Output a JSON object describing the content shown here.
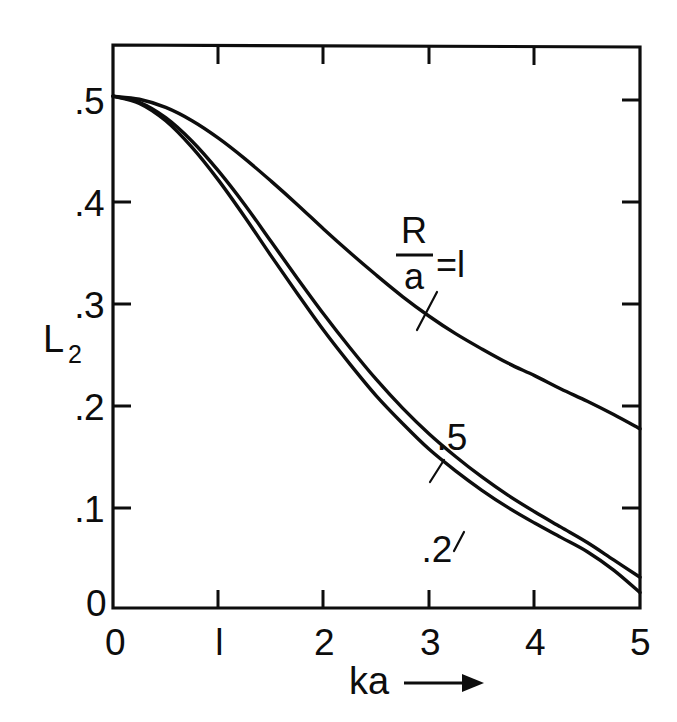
{
  "figure": {
    "background_color": "#ffffff",
    "ink_color": "#0d0d0d"
  },
  "chart_data": {
    "type": "line",
    "title": "",
    "subtitle": "",
    "xlabel": "ka",
    "xlabel_suffix": "⟶",
    "ylabel": "L",
    "ylabel_subscript": "2",
    "xlim": [
      0,
      5
    ],
    "ylim": [
      0,
      0.55
    ],
    "grid": false,
    "legend": "inline-curve-labels",
    "x_ticks": [
      0,
      1,
      2,
      3,
      4,
      5
    ],
    "x_tick_labels": [
      "0",
      "l",
      "2",
      "3",
      "4",
      "5"
    ],
    "y_ticks": [
      0,
      0.1,
      0.2,
      0.3,
      0.4,
      0.5
    ],
    "y_tick_labels": [
      "0",
      ".1",
      ".2",
      ".3",
      ".4",
      ".5"
    ],
    "x": [
      0,
      0.25,
      0.5,
      0.75,
      1.0,
      1.25,
      1.5,
      1.75,
      2.0,
      2.25,
      2.5,
      2.75,
      3.0,
      3.25,
      3.5,
      3.75,
      4.0,
      4.25,
      4.5,
      4.75,
      5.0
    ],
    "series": [
      {
        "name": "R/a = 1",
        "label": "1",
        "values": [
          0.5,
          0.497,
          0.489,
          0.476,
          0.459,
          0.439,
          0.417,
          0.394,
          0.37,
          0.347,
          0.325,
          0.304,
          0.285,
          0.268,
          0.253,
          0.239,
          0.227,
          0.214,
          0.202,
          0.189,
          0.175
        ]
      },
      {
        "name": "R/a = .5",
        "label": ".5",
        "values": [
          0.5,
          0.494,
          0.479,
          0.456,
          0.427,
          0.394,
          0.358,
          0.322,
          0.287,
          0.254,
          0.223,
          0.195,
          0.17,
          0.148,
          0.128,
          0.11,
          0.094,
          0.079,
          0.064,
          0.047,
          0.03
        ]
      },
      {
        "name": "R/a = .2",
        "label": ".2",
        "values": [
          0.5,
          0.493,
          0.476,
          0.45,
          0.418,
          0.382,
          0.344,
          0.307,
          0.271,
          0.238,
          0.207,
          0.18,
          0.155,
          0.134,
          0.115,
          0.098,
          0.083,
          0.069,
          0.055,
          0.037,
          0.015
        ]
      }
    ],
    "annotations": [
      {
        "text": "R",
        "role": "fraction-numerator"
      },
      {
        "text": "a",
        "role": "fraction-denominator"
      },
      {
        "text": "=l",
        "role": "fraction-equals-value"
      },
      {
        "text": ".5",
        "role": "curve-label"
      },
      {
        "text": ".2",
        "role": "curve-label"
      }
    ]
  },
  "labels": {
    "y_axis_title": "L",
    "y_axis_subscript": "2",
    "x_axis_title": "ka",
    "tick_y_5": ".5",
    "tick_y_4": ".4",
    "tick_y_3": ".3",
    "tick_y_2": ".2",
    "tick_y_1": ".1",
    "tick_y_0": "0",
    "tick_x_0": "0",
    "tick_x_1": "l",
    "tick_x_2": "2",
    "tick_x_3": "3",
    "tick_x_4": "4",
    "tick_x_5": "5",
    "curve_1_num": "R",
    "curve_1_den": "a",
    "curve_1_eq": "=l",
    "curve_2": ".5",
    "curve_3": ".2"
  }
}
